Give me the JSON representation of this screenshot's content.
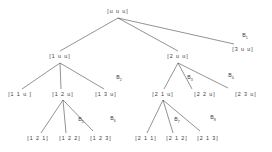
{
  "diagram": {
    "type": "tree",
    "ink_color": "#4a4a4a",
    "text_color": "#3a3a3a",
    "nodes": [
      {
        "id": "root",
        "label": "[u u u]",
        "x": 118,
        "y": 12,
        "level": 0
      },
      {
        "id": "n1",
        "label": "[1 u u]",
        "x": 60,
        "y": 57,
        "level": 1
      },
      {
        "id": "n2",
        "label": "[2 u u]",
        "x": 178,
        "y": 57,
        "level": 1
      },
      {
        "id": "n3",
        "label": "[3 u u]",
        "x": 243,
        "y": 50,
        "level": 1
      },
      {
        "id": "n11",
        "label": "[1 1 u ]",
        "x": 20,
        "y": 95,
        "level": 2
      },
      {
        "id": "n12",
        "label": "[1 2 u]",
        "x": 63,
        "y": 95,
        "level": 2
      },
      {
        "id": "n13",
        "label": "[1 3 u]",
        "x": 106,
        "y": 95,
        "level": 2
      },
      {
        "id": "n21",
        "label": "[2 1 u]",
        "x": 163,
        "y": 95,
        "level": 2
      },
      {
        "id": "n22",
        "label": "[2 2 u]",
        "x": 205,
        "y": 95,
        "level": 2
      },
      {
        "id": "n23",
        "label": "[2 3 u]",
        "x": 246,
        "y": 95,
        "level": 2
      },
      {
        "id": "n121",
        "label": "[1 2 1]",
        "x": 38,
        "y": 139,
        "level": 3
      },
      {
        "id": "n122",
        "label": "[1 2 2]",
        "x": 70,
        "y": 139,
        "level": 3
      },
      {
        "id": "n123",
        "label": "[1 2 3]",
        "x": 101,
        "y": 139,
        "level": 3
      },
      {
        "id": "n211",
        "label": "[2 1 1]",
        "x": 146,
        "y": 139,
        "level": 3
      },
      {
        "id": "n212",
        "label": "[2 1 2]",
        "x": 177,
        "y": 139,
        "level": 3
      },
      {
        "id": "n213",
        "label": "[2 1 3]",
        "x": 208,
        "y": 139,
        "level": 3
      }
    ],
    "edges": [
      {
        "from": "root",
        "to": "n1",
        "x1": 118,
        "y1": 18,
        "x2": 60,
        "y2": 51
      },
      {
        "from": "root",
        "to": "n2",
        "x1": 118,
        "y1": 18,
        "x2": 178,
        "y2": 51
      },
      {
        "from": "root",
        "to": "n3",
        "x1": 118,
        "y1": 18,
        "x2": 234,
        "y2": 44
      },
      {
        "from": "n1",
        "to": "n11",
        "x1": 60,
        "y1": 63,
        "x2": 22,
        "y2": 89
      },
      {
        "from": "n1",
        "to": "n12",
        "x1": 60,
        "y1": 63,
        "x2": 61,
        "y2": 89
      },
      {
        "from": "n1",
        "to": "n13",
        "x1": 60,
        "y1": 63,
        "x2": 104,
        "y2": 89
      },
      {
        "from": "n2",
        "to": "n21",
        "x1": 178,
        "y1": 63,
        "x2": 164,
        "y2": 89
      },
      {
        "from": "n2",
        "to": "n22",
        "x1": 178,
        "y1": 63,
        "x2": 192,
        "y2": 89
      },
      {
        "from": "n2",
        "to": "n23",
        "x1": 178,
        "y1": 63,
        "x2": 228,
        "y2": 88
      },
      {
        "from": "n12",
        "to": "n121",
        "x1": 63,
        "y1": 100,
        "x2": 41,
        "y2": 133
      },
      {
        "from": "n12",
        "to": "n122",
        "x1": 63,
        "y1": 100,
        "x2": 66,
        "y2": 133
      },
      {
        "from": "n12",
        "to": "n123",
        "x1": 63,
        "y1": 100,
        "x2": 93,
        "y2": 131
      },
      {
        "from": "n21",
        "to": "n211",
        "x1": 163,
        "y1": 100,
        "x2": 147,
        "y2": 133
      },
      {
        "from": "n21",
        "to": "n212",
        "x1": 163,
        "y1": 100,
        "x2": 173,
        "y2": 133
      },
      {
        "from": "n21",
        "to": "n213",
        "x1": 163,
        "y1": 100,
        "x2": 200,
        "y2": 131
      }
    ],
    "branch_labels": [
      {
        "id": "B1",
        "base": "B",
        "sub": "1",
        "x": 245,
        "y": 37
      },
      {
        "id": "B2",
        "base": "B",
        "sub": "2",
        "x": 119,
        "y": 79
      },
      {
        "id": "B3",
        "base": "B",
        "sub": "3",
        "x": 190,
        "y": 79
      },
      {
        "id": "B4",
        "base": "B",
        "sub": "4",
        "x": 231,
        "y": 77
      },
      {
        "id": "B5",
        "base": "B",
        "sub": "5",
        "x": 81,
        "y": 121
      },
      {
        "id": "B6",
        "base": "B",
        "sub": "6",
        "x": 113,
        "y": 120
      },
      {
        "id": "B7",
        "base": "B",
        "sub": "7",
        "x": 177,
        "y": 121
      },
      {
        "id": "B8",
        "base": "B",
        "sub": "8",
        "x": 213,
        "y": 119
      }
    ]
  }
}
